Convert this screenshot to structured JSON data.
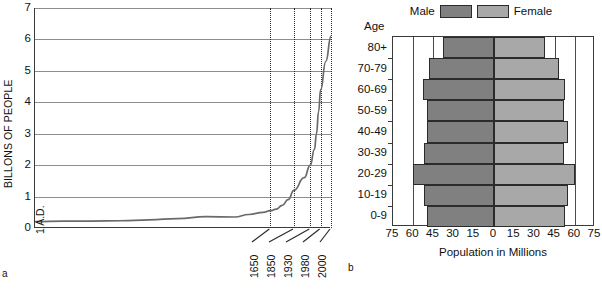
{
  "figure_a": {
    "panel_letter": "a",
    "ylabel": "BILLONS OF PEOPLE",
    "y_ticks": [
      "0",
      "1",
      "2",
      "3",
      "4",
      "5",
      "6",
      "7"
    ],
    "x_first_label": "1 A.D.",
    "x_labels": [
      "1650",
      "1850",
      "1930",
      "1980",
      "2000"
    ]
  },
  "figure_b": {
    "panel_letter": "b",
    "legend": {
      "male_label": "Male",
      "female_label": "Female",
      "male_color": "#808080",
      "female_color": "#a8a8a8"
    },
    "age_caption": "Age",
    "xlabel": "Population in Millions",
    "x_ticks": [
      "75",
      "60",
      "45",
      "30",
      "15",
      "0",
      "15",
      "30",
      "45",
      "60",
      "75"
    ],
    "age_groups": [
      "80+",
      "70-79",
      "60-69",
      "50-59",
      "40-49",
      "30-39",
      "20-29",
      "10-19",
      "0-9"
    ]
  },
  "chart_data": [
    {
      "type": "line",
      "id": "figure-a-world-population",
      "panel": "a",
      "title": "",
      "xlabel": "",
      "ylabel": "BILLONS OF PEOPLE",
      "ylim": [
        0,
        7
      ],
      "y_ticks": [
        0,
        1,
        2,
        3,
        4,
        5,
        6,
        7
      ],
      "x_tick_labels": [
        "1 A.D.",
        "1650",
        "1850",
        "1930",
        "1980",
        "2000"
      ],
      "x_dotted_reference_years": [
        1650,
        1850,
        1930,
        1980,
        2000
      ],
      "grid": "horizontal",
      "legend": "none",
      "x": [
        1,
        200,
        400,
        600,
        800,
        1000,
        1200,
        1400,
        1500,
        1600,
        1650,
        1700,
        1750,
        1800,
        1850,
        1900,
        1930,
        1950,
        1960,
        1970,
        1980,
        1990,
        2000
      ],
      "y": [
        0.2,
        0.22,
        0.22,
        0.23,
        0.26,
        0.3,
        0.36,
        0.35,
        0.43,
        0.5,
        0.55,
        0.6,
        0.72,
        0.9,
        1.2,
        1.6,
        2.0,
        2.5,
        3.0,
        3.7,
        4.4,
        5.3,
        6.1
      ],
      "series": [
        {
          "name": "World population (billions)",
          "values": [
            0.2,
            0.22,
            0.22,
            0.23,
            0.26,
            0.3,
            0.36,
            0.35,
            0.43,
            0.5,
            0.55,
            0.6,
            0.72,
            0.9,
            1.2,
            1.6,
            2.0,
            2.5,
            3.0,
            3.7,
            4.4,
            5.3,
            6.1
          ]
        }
      ]
    },
    {
      "type": "bar",
      "id": "figure-b-population-pyramid",
      "panel": "b",
      "orientation": "horizontal-pyramid",
      "title": "",
      "xlabel": "Population in Millions",
      "ylabel": "Age",
      "xlim": [
        -75,
        75
      ],
      "x_ticks": [
        75,
        60,
        45,
        30,
        15,
        0,
        15,
        30,
        45,
        60,
        75
      ],
      "grid": "vertical",
      "legend": "top-center",
      "categories": [
        "80+",
        "70-79",
        "60-69",
        "50-59",
        "40-49",
        "30-39",
        "20-29",
        "10-19",
        "0-9"
      ],
      "series": [
        {
          "name": "Male",
          "values": [
            38,
            48,
            53,
            50,
            50,
            52,
            60,
            52,
            50
          ]
        },
        {
          "name": "Female",
          "values": [
            38,
            48,
            53,
            52,
            55,
            52,
            60,
            55,
            53
          ]
        }
      ]
    }
  ]
}
